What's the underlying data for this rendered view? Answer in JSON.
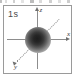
{
  "figure": {
    "orbital_label": "1s",
    "caption": "1s atomic orbital electron density on xyz axes",
    "frame_color": "#9a9a9a",
    "background_color": "#ffffff",
    "axis_color": "#8d8d8d",
    "cloud_color": "#1d1d1d"
  },
  "axes": {
    "z": {
      "label": "z",
      "direction": "up",
      "style": "solid",
      "arrow": "z-axis-arrow"
    },
    "x": {
      "label": "x",
      "direction": "right",
      "style": "solid",
      "arrow": "x-axis-arrow"
    },
    "y": {
      "label": "y",
      "direction": "down-left",
      "style": "dotted",
      "arrow": "y-axis-arrow"
    }
  },
  "chart_data": {
    "type": "scatter",
    "title": "1s",
    "xlabel": "x",
    "ylabel": "y",
    "zlabel": "z",
    "grid": false,
    "legend": null,
    "annotations": [
      "1s"
    ],
    "series": [
      {
        "name": "1s electron density",
        "shape": "sphere",
        "center": [
          0,
          0,
          0
        ],
        "radius": 13,
        "gradient_stops": [
          {
            "offset": 0.0,
            "color": "#1d1d1d"
          },
          {
            "offset": 0.18,
            "color": "#262626"
          },
          {
            "offset": 0.33,
            "color": "#3a3a3a"
          },
          {
            "offset": 0.47,
            "color": "#5c5c5c"
          },
          {
            "offset": 0.62,
            "color": "#8a8a8a"
          },
          {
            "offset": 0.76,
            "color": "#b8b8b8"
          },
          {
            "offset": 0.88,
            "color": "#dcdcdc"
          },
          {
            "offset": 1.0,
            "color": "#ffffff"
          }
        ]
      }
    ]
  }
}
